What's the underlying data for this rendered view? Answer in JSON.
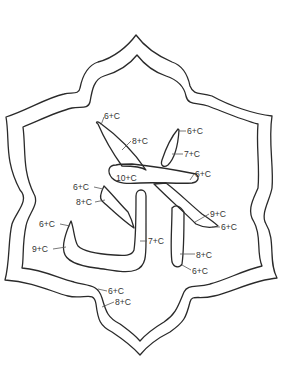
{
  "diagram": {
    "title": "",
    "colors": {
      "line": "#2a2a2a",
      "label": "#333333",
      "background": "#ffffff"
    },
    "labels": [
      {
        "id": "l1",
        "text": "6+C",
        "x": 104,
        "y": 119
      },
      {
        "id": "l2",
        "text": "8+C",
        "x": 132,
        "y": 144
      },
      {
        "id": "l3",
        "text": "6+C",
        "x": 187,
        "y": 134
      },
      {
        "id": "l4",
        "text": "7+C",
        "x": 184,
        "y": 157
      },
      {
        "id": "l5",
        "text": "10+C",
        "x": 129,
        "y": 181
      },
      {
        "id": "l6",
        "text": "6+C",
        "x": 195,
        "y": 177
      },
      {
        "id": "l7",
        "text": "6+C",
        "x": 73,
        "y": 190
      },
      {
        "id": "l8",
        "text": "8+C",
        "x": 76,
        "y": 205
      },
      {
        "id": "l9",
        "text": "9+C",
        "x": 210,
        "y": 217
      },
      {
        "id": "l10",
        "text": "6+C",
        "x": 221,
        "y": 230
      },
      {
        "id": "l11",
        "text": "6+C",
        "x": 39,
        "y": 227
      },
      {
        "id": "l12",
        "text": "7+C",
        "x": 148,
        "y": 244
      },
      {
        "id": "l13",
        "text": "9+C",
        "x": 32,
        "y": 252
      },
      {
        "id": "l14",
        "text": "8+C",
        "x": 196,
        "y": 258
      },
      {
        "id": "l15",
        "text": "6+C",
        "x": 192,
        "y": 274
      },
      {
        "id": "l16",
        "text": "6+C",
        "x": 108,
        "y": 294
      },
      {
        "id": "l17",
        "text": "8+C",
        "x": 115,
        "y": 305
      }
    ]
  }
}
